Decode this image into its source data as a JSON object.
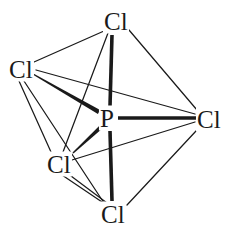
{
  "figure": {
    "name": "phosphorus-pentachloride-structure",
    "molecule_formula": "PCl5",
    "geometry": "trigonal bipyramidal",
    "width": 229,
    "height": 234,
    "background_color": "#ffffff",
    "line_color": "#1a1a1a",
    "text_color": "#1a1a1a"
  },
  "atoms": [
    {
      "id": "p-center",
      "label": "P",
      "element": "P",
      "role": "central-atom",
      "x": 107,
      "y": 118
    },
    {
      "id": "cl-top",
      "label": "Cl",
      "element": "Cl",
      "role": "axial-chlorine-top",
      "x": 116,
      "y": 21
    },
    {
      "id": "cl-bottom",
      "label": "Cl",
      "element": "Cl",
      "role": "axial-chlorine-bottom",
      "x": 113,
      "y": 214
    },
    {
      "id": "cl-left",
      "label": "Cl",
      "element": "Cl",
      "role": "equatorial-chlorine-left",
      "x": 21,
      "y": 69
    },
    {
      "id": "cl-lower-left",
      "label": "Cl",
      "element": "Cl",
      "role": "equatorial-chlorine-lower-left",
      "x": 59,
      "y": 164
    },
    {
      "id": "cl-right",
      "label": "Cl",
      "element": "Cl",
      "role": "equatorial-chlorine-right",
      "x": 209,
      "y": 119
    }
  ],
  "bonds": [
    {
      "id": "bond-p-cl-top",
      "from": "P",
      "to": "Cl",
      "style": "thick",
      "width": 3.6,
      "x1": 112,
      "y1": 35,
      "x2": 110,
      "y2": 106
    },
    {
      "id": "bond-p-cl-bottom",
      "from": "P",
      "to": "Cl",
      "style": "thick",
      "width": 3.6,
      "x1": 110,
      "y1": 131,
      "x2": 112,
      "y2": 201
    },
    {
      "id": "bond-p-cl-right",
      "from": "P",
      "to": "Cl",
      "style": "thick",
      "width": 3.6,
      "x1": 118,
      "y1": 118,
      "x2": 196,
      "y2": 118
    },
    {
      "id": "bond-p-cl-left",
      "from": "P",
      "to": "Cl",
      "style": "wedge",
      "width": 4.4,
      "x1": 33,
      "y1": 74,
      "x2": 99,
      "y2": 112
    },
    {
      "id": "bond-p-cl-lower-left",
      "from": "P",
      "to": "Cl",
      "style": "wedge",
      "width": 4.0,
      "x1": 73,
      "y1": 153,
      "x2": 101,
      "y2": 127
    }
  ],
  "outline_edges": [
    {
      "id": "edge-top-left",
      "x1": 104,
      "y1": 31,
      "x2": 34,
      "y2": 62
    },
    {
      "id": "edge-top-right",
      "x1": 129,
      "y1": 30,
      "x2": 197,
      "y2": 110
    },
    {
      "id": "edge-top-lowerleft",
      "x1": 108,
      "y1": 33,
      "x2": 63,
      "y2": 152
    },
    {
      "id": "edge-left-right",
      "x1": 36,
      "y1": 70,
      "x2": 195,
      "y2": 114
    },
    {
      "id": "edge-left-lowerleft",
      "x1": 19,
      "y1": 81,
      "x2": 51,
      "y2": 152
    },
    {
      "id": "edge-left-bottom",
      "x1": 24,
      "y1": 81,
      "x2": 104,
      "y2": 203
    },
    {
      "id": "edge-lowerleft-right",
      "x1": 72,
      "y1": 160,
      "x2": 195,
      "y2": 122
    },
    {
      "id": "edge-lowerleft-bottom",
      "x1": 62,
      "y1": 175,
      "x2": 105,
      "y2": 204
    },
    {
      "id": "edge-lowerleft-bottom2",
      "x1": 71,
      "y1": 176,
      "x2": 107,
      "y2": 203
    },
    {
      "id": "edge-right-bottom",
      "x1": 196,
      "y1": 131,
      "x2": 127,
      "y2": 205
    }
  ]
}
